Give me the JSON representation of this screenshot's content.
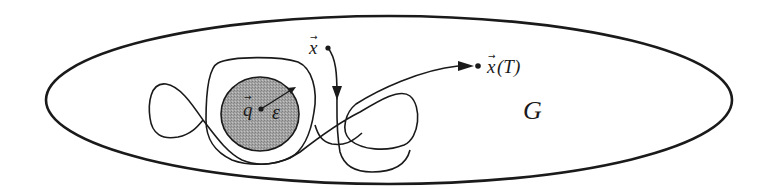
{
  "diagram": {
    "type": "phase-space trajectory in domain",
    "domain_region": {
      "label": "G",
      "shape": "ellipse",
      "stroke": "#1a1a1a",
      "fill": "#ffffff"
    },
    "target_ball": {
      "center_label": "q",
      "radius_label": "ε",
      "fill": "#9a9a9a",
      "stroke": "#1a1a1a"
    },
    "start_point": {
      "label": "x"
    },
    "end_point": {
      "label": "x(T)",
      "base": "x",
      "arg": "(T)"
    },
    "vector_arrow_glyph": "→",
    "colors": {
      "ink": "#1a1a1a",
      "ball_fill": "#9a9a9a",
      "background": "#ffffff"
    }
  }
}
